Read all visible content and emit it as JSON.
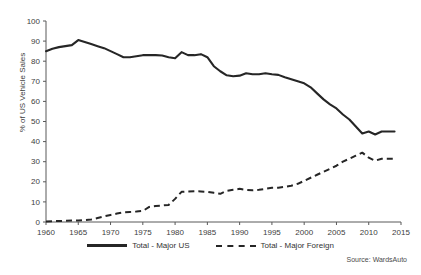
{
  "chart_data": {
    "type": "line",
    "title": "",
    "subtitle": "",
    "xlabel": "",
    "ylabel": "% of US Vehicle Sales",
    "xlim": [
      1960,
      2015
    ],
    "ylim": [
      0,
      100
    ],
    "grid": false,
    "legend_position": "bottom-center",
    "x_ticks": [
      1960,
      1965,
      1970,
      1975,
      1980,
      1985,
      1990,
      1995,
      2000,
      2005,
      2010,
      2015
    ],
    "y_ticks": [
      0,
      10,
      20,
      30,
      40,
      50,
      60,
      70,
      80,
      90,
      100
    ],
    "source_note": "Source: WardsAuto",
    "x": [
      1960,
      1961,
      1962,
      1963,
      1964,
      1965,
      1966,
      1967,
      1968,
      1969,
      1970,
      1971,
      1972,
      1973,
      1974,
      1975,
      1976,
      1977,
      1978,
      1979,
      1980,
      1981,
      1982,
      1983,
      1984,
      1985,
      1986,
      1987,
      1988,
      1989,
      1990,
      1991,
      1992,
      1993,
      1994,
      1995,
      1996,
      1997,
      1998,
      1999,
      2000,
      2001,
      2002,
      2003,
      2004,
      2005,
      2006,
      2007,
      2008,
      2009,
      2010,
      2011,
      2012,
      2013,
      2014
    ],
    "series": [
      {
        "name": "Total - Major US",
        "style": "solid",
        "color": "#262626",
        "values": [
          85.0,
          86.2,
          87.0,
          87.5,
          88.0,
          90.5,
          89.5,
          88.5,
          87.5,
          86.5,
          85.0,
          83.5,
          82.0,
          82.0,
          82.5,
          83.0,
          83.0,
          83.0,
          82.8,
          82.0,
          81.5,
          84.5,
          83.0,
          83.0,
          83.5,
          82.0,
          77.5,
          75.0,
          73.0,
          72.5,
          72.8,
          74.0,
          73.5,
          73.5,
          74.0,
          73.5,
          73.2,
          72.0,
          71.0,
          70.0,
          69.0,
          67.0,
          64.0,
          61.0,
          58.5,
          56.5,
          53.5,
          51.0,
          47.5,
          44.0,
          45.0,
          43.5,
          45.0,
          45.0,
          45.0
        ]
      },
      {
        "name": "Total - Major Foreign",
        "style": "dashed",
        "color": "#262626",
        "values": [
          0.3,
          0.4,
          0.5,
          0.6,
          0.7,
          0.8,
          1.0,
          1.2,
          2.0,
          2.8,
          3.5,
          4.2,
          4.8,
          5.0,
          5.2,
          5.5,
          7.5,
          8.0,
          8.2,
          8.5,
          11.5,
          15.0,
          15.2,
          15.3,
          15.2,
          15.0,
          14.5,
          14.0,
          15.5,
          16.0,
          16.5,
          16.0,
          15.8,
          16.0,
          16.5,
          17.0,
          17.0,
          17.5,
          18.0,
          19.0,
          20.5,
          22.0,
          23.5,
          25.0,
          26.5,
          28.0,
          30.0,
          31.5,
          33.0,
          34.5,
          32.0,
          30.5,
          31.5,
          31.5,
          31.5
        ]
      }
    ]
  },
  "legend": {
    "items": [
      {
        "label": "Total - Major US",
        "style": "solid"
      },
      {
        "label": "Total - Major Foreign",
        "style": "dashed"
      }
    ]
  }
}
